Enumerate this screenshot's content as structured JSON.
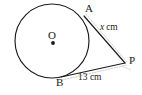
{
  "figure": {
    "type": "geometry-diagram",
    "background_color": "#ffffff",
    "stroke_color": "#1a1a1a",
    "guide_color": "#b9b9b9",
    "points": [
      {
        "id": "A",
        "label": "A",
        "x": 84,
        "y": 16,
        "label_x": 85,
        "label_y": 3,
        "on_circle": true
      },
      {
        "id": "B",
        "label": "B",
        "x": 61,
        "y": 77,
        "label_x": 56,
        "label_y": 77,
        "on_circle": true
      },
      {
        "id": "P",
        "label": "P",
        "x": 125,
        "y": 63,
        "label_x": 129,
        "label_y": 55,
        "on_circle": false
      },
      {
        "id": "O",
        "label": "O",
        "x": 53,
        "y": 43,
        "label_x": 48,
        "label_y": 30,
        "on_circle": false
      }
    ],
    "circle": {
      "cx": 52,
      "cy": 41,
      "r": 37
    },
    "segments": [
      {
        "id": "AP",
        "from": "A",
        "to": "P",
        "style": "solid",
        "length_label": "x cm"
      },
      {
        "id": "BP",
        "from": "B",
        "to": "P",
        "style": "solid",
        "length_label": "13 cm"
      }
    ],
    "guides": [
      {
        "id": "guide-ap",
        "from": "A",
        "to": "P",
        "style": "dotted"
      },
      {
        "id": "guide-bp",
        "from": "B",
        "to": "P",
        "style": "dotted"
      }
    ],
    "measure_labels": {
      "tangent_a": {
        "variable": "x",
        "unit": "cm"
      },
      "tangent_b": {
        "value": "13",
        "unit": "cm",
        "full": "13 cm"
      }
    }
  }
}
